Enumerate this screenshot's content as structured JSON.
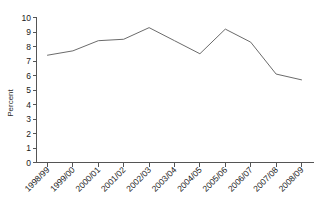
{
  "chart_data": {
    "type": "line",
    "title": "",
    "subtitle": "",
    "xlabel": "",
    "ylabel": "Percent",
    "categories": [
      "1998/99",
      "1999/00",
      "2000/01",
      "2001/02",
      "2002/03",
      "2003/04",
      "2004/05",
      "2005/06",
      "2006/07",
      "2007/08",
      "2008/09"
    ],
    "values": [
      7.4,
      7.7,
      8.4,
      8.5,
      9.3,
      8.4,
      7.5,
      9.2,
      8.3,
      6.1,
      5.7
    ],
    "series": [
      {
        "name": "Percent",
        "values": [
          7.4,
          7.7,
          8.4,
          8.5,
          9.3,
          8.4,
          7.5,
          9.2,
          8.3,
          6.1,
          5.7
        ]
      }
    ],
    "ylim": [
      0,
      10
    ],
    "ytick_labels": [
      "0",
      "1",
      "2",
      "3",
      "4",
      "5",
      "6",
      "7",
      "8",
      "9",
      "10"
    ],
    "ytick_values": [
      0,
      1,
      2,
      3,
      4,
      5,
      6,
      7,
      8,
      9,
      10
    ],
    "grid": false,
    "legend": false,
    "legend_position": "none",
    "line_color": "#6b6b6b",
    "axis_color": "#555555",
    "text_color": "#1a1a1a",
    "background_color": "#ffffff",
    "markers": false,
    "xtick_label_rotation": -45
  }
}
